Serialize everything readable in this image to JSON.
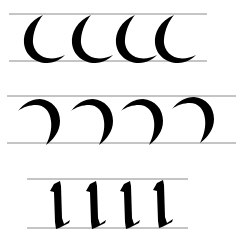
{
  "diagram": {
    "rows": [
      {
        "name": "left-crescent-strokes",
        "stroke": "left-facing crescent (c-curve)",
        "count": 4,
        "guide_top_y": 14,
        "guide_bottom_y": 61,
        "guide_x1": 9,
        "guide_x2": 207,
        "xs": [
          23,
          71,
          115,
          154
        ]
      },
      {
        "name": "right-crescent-strokes",
        "stroke": "right-facing crescent (reverse curve)",
        "count": 4,
        "guide_top_y": 96,
        "guide_bottom_y": 143,
        "guide_x1": 7,
        "guide_x2": 236,
        "xs": [
          18,
          71,
          121,
          172
        ]
      },
      {
        "name": "vertical-minim-strokes",
        "stroke": "vertical minim with broken-pen ends",
        "count": 4,
        "guide_top_y": 179,
        "guide_bottom_y": 228,
        "guide_x1": 27,
        "guide_x2": 188,
        "xs": [
          52,
          88,
          122,
          155
        ]
      }
    ],
    "colors": {
      "ink": "#000000",
      "guide": "#8a8a8a",
      "paper": "#ffffff"
    }
  }
}
